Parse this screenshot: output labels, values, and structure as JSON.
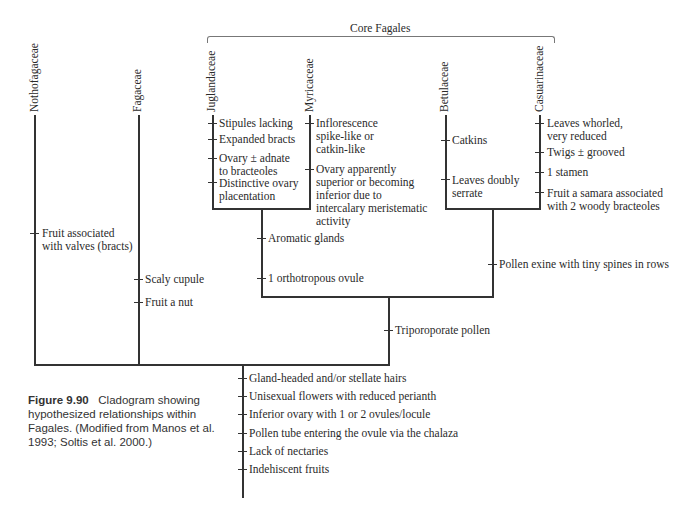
{
  "figure": {
    "group_label": "Core Fagales",
    "caption_number": "Figure 9.90",
    "caption_text": "Cladogram showing hypothesized relationships within Fagales. (Modified from Manos et al. 1993; Soltis et al. 2000.)"
  },
  "taxa": [
    {
      "name": "Nothofagaceae"
    },
    {
      "name": "Fagaceae"
    },
    {
      "name": "Juglandaceae"
    },
    {
      "name": "Myricaceae"
    },
    {
      "name": "Betulaceae"
    },
    {
      "name": "Casuarinaceae"
    }
  ],
  "characters": {
    "nothofagaceae": [
      "Fruit associated\nwith valves (bracts)"
    ],
    "fagaceae": [
      "Scaly cupule",
      "Fruit a nut"
    ],
    "juglandaceae": [
      "Stipules lacking",
      "Expanded bracts",
      "Ovary ± adnate\nto bracteoles",
      "Distinctive ovary\nplacentation"
    ],
    "myricaceae": [
      "Inflorescence\nspike-like or\ncatkin-like",
      "Ovary apparently\nsuperior or becoming\ninferior due to\nintercalary meristematic\nactivity"
    ],
    "betulaceae": [
      "Catkins",
      "Leaves doubly\nserrate"
    ],
    "casuarinaceae": [
      "Leaves whorled,\nvery reduced",
      "Twigs ± grooved",
      "1 stamen",
      "Fruit a samara associated\nwith 2 woody bracteoles"
    ],
    "juglandaceae_myricaceae": [
      "Aromatic glands",
      "1 orthotropous ovule"
    ],
    "betulaceae_casuarinaceae": [
      "Pollen exine with tiny spines in rows"
    ],
    "core_fagales": [
      "Triporoporate pollen"
    ],
    "fagales": [
      "Gland-headed and/or stellate hairs",
      "Unisexual flowers with reduced perianth",
      "Inferior ovary with 1 or 2 ovules/locule",
      "Pollen tube entering the ovule via the chalaza",
      "Lack of nectaries",
      "Indehiscent fruits"
    ]
  }
}
